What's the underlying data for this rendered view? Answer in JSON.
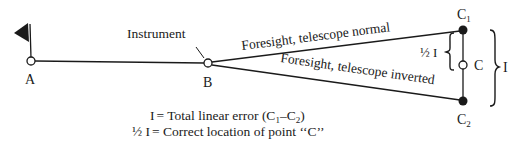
{
  "diagram": {
    "points": {
      "A": {
        "label": "A"
      },
      "B": {
        "label": "B",
        "annotation": "Instrument"
      },
      "C1": {
        "label": "C",
        "sub": "1"
      },
      "C": {
        "label": "C"
      },
      "C2": {
        "label": "C",
        "sub": "2"
      }
    },
    "lines": {
      "upper": "Foresight, telescope normal",
      "lower": "Foresight, telescope inverted"
    },
    "braces": {
      "half": "½ I",
      "full": "I"
    },
    "legend": {
      "line1_lhs": "I",
      "line1_rhs": "= Total linear error (C",
      "line1_sub1": "1",
      "line1_mid": "–C",
      "line1_sub2": "2",
      "line1_end": ")",
      "line2_lhs": "½ I",
      "line2_rhs": "= Correct location of point ‘‘C’’"
    },
    "colors": {
      "ink": "#1a1a1a",
      "background": "#ffffff"
    }
  }
}
